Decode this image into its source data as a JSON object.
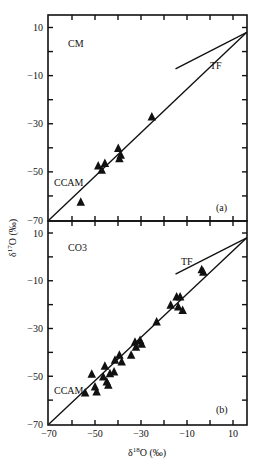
{
  "chart_data": [
    {
      "type": "scatter",
      "panel": "(a)",
      "sample_label": "CM",
      "xlabel": "δ18O (‰)",
      "ylabel": "δ17O (‰)",
      "xlim": [
        -70,
        16
      ],
      "ylim": [
        -70,
        15
      ],
      "xticks": [
        -70,
        -60,
        -50,
        -40,
        -30,
        -20,
        -10,
        0,
        10
      ],
      "xtick_labels": [],
      "yticks": [
        -70,
        -60,
        -50,
        -40,
        -30,
        -20,
        -10,
        0,
        10
      ],
      "ytick_labels": [
        "10",
        "-10",
        "-30",
        "-50",
        "-70"
      ],
      "ytick_label_values": [
        10,
        -10,
        -30,
        -50,
        -70
      ],
      "lines": [
        {
          "name": "CCAM",
          "x": [
            -70,
            16
          ],
          "y": [
            -70,
            8
          ]
        },
        {
          "name": "TF",
          "x": [
            -15,
            16
          ],
          "y": [
            -7.2,
            8
          ]
        }
      ],
      "series": [
        {
          "name": "CM",
          "marker": "triangle",
          "x": [
            -56.2,
            -48.6,
            -47.1,
            -45.7,
            -39.9,
            -39.4,
            -38.8,
            -25.3
          ],
          "y": [
            -62.4,
            -47.3,
            -49.1,
            -46.3,
            -40.1,
            -44.3,
            -42.9,
            -27.0
          ]
        }
      ]
    },
    {
      "type": "scatter",
      "panel": "(b)",
      "sample_label": "CO3",
      "xlabel": "δ18O (‰)",
      "ylabel": "δ17O (‰)",
      "xlim": [
        -70,
        16
      ],
      "ylim": [
        -70,
        15
      ],
      "xticks": [
        -70,
        -60,
        -50,
        -40,
        -30,
        -20,
        -10,
        0,
        10
      ],
      "xtick_labels": [
        "-70",
        "-50",
        "-30",
        "-10",
        "10"
      ],
      "xtick_label_values": [
        -70,
        -50,
        -30,
        -10,
        10
      ],
      "yticks": [
        -70,
        -60,
        -50,
        -40,
        -30,
        -20,
        -10,
        0,
        10
      ],
      "ytick_labels": [
        "10",
        "-10",
        "-30",
        "-50",
        "-70"
      ],
      "ytick_label_values": [
        10,
        -10,
        -30,
        -50,
        -70
      ],
      "lines": [
        {
          "name": "CCAM",
          "x": [
            -70,
            16
          ],
          "y": [
            -70,
            8
          ]
        },
        {
          "name": "TF",
          "x": [
            -15,
            16
          ],
          "y": [
            -7.2,
            8
          ]
        }
      ],
      "series": [
        {
          "name": "CO3",
          "marker": "triangle",
          "x": [
            -51.4,
            -54.3,
            -50.0,
            -49.3,
            -45.7,
            -46.4,
            -44.9,
            -44.2,
            -43.5,
            -41.7,
            -41.3,
            -39.4,
            -38.4,
            -34.3,
            -32.6,
            -32.2,
            -30.4,
            -29.7,
            -23.2,
            -17.1,
            -14.5,
            -13.0,
            -13.8,
            -11.9,
            -3.6,
            -2.9
          ],
          "y": [
            -49.0,
            -56.8,
            -54.3,
            -56.4,
            -45.6,
            -50.1,
            -52.2,
            -53.6,
            -48.7,
            -48.0,
            -43.1,
            -41.0,
            -43.8,
            -41.0,
            -35.5,
            -37.6,
            -34.8,
            -36.4,
            -27.1,
            -20.1,
            -16.6,
            -16.6,
            -20.8,
            -22.2,
            -5.2,
            -6.2
          ]
        }
      ]
    }
  ],
  "labels": {
    "panel_a_sample": "CM",
    "panel_b_sample": "CO3",
    "panel_a_tag": "(a)",
    "panel_b_tag": "(b)",
    "line_ccam": "CCAM",
    "line_tf": "TF",
    "xaxis_title_delta": "δ",
    "xaxis_title_sup": "18",
    "xaxis_title_rest": "O (‰)",
    "yaxis_title_delta": "δ",
    "yaxis_title_sup": "17",
    "yaxis_title_rest": "O (‰)"
  },
  "style": {
    "ink": "#111111",
    "background": "#ffffff"
  }
}
